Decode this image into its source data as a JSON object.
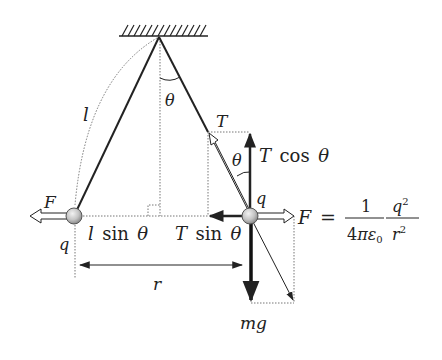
{
  "diagram": {
    "labels": {
      "length": "l",
      "angle_top": "θ",
      "angle_right": "θ",
      "tension": "T",
      "tension_vertical": "T cos θ",
      "tension_vertical_var": "T",
      "tension_vertical_fn": "cos",
      "tension_vertical_arg": "θ",
      "tension_horizontal_var": "T",
      "tension_horizontal_fn": "sin",
      "tension_horizontal_arg": "θ",
      "half_separation_var": "l",
      "half_separation_fn": "sin",
      "half_separation_arg": "θ",
      "charge_left": "q",
      "charge_right": "q",
      "force_left": "F",
      "force_right": "F",
      "separation": "r",
      "weight": "mg"
    },
    "formula": {
      "lhs": "F",
      "equals": "=",
      "num1": "1",
      "den1_a": "4",
      "den1_pi": "π",
      "den1_eps": "ε",
      "den1_sub": "0",
      "num2": "q",
      "num2_exp": "2",
      "den2": "r",
      "den2_exp": "2"
    },
    "colors": {
      "line": "#222222",
      "dotted": "#666666",
      "ball_fill": "#c8c8c8",
      "ball_stroke": "#555555"
    }
  }
}
